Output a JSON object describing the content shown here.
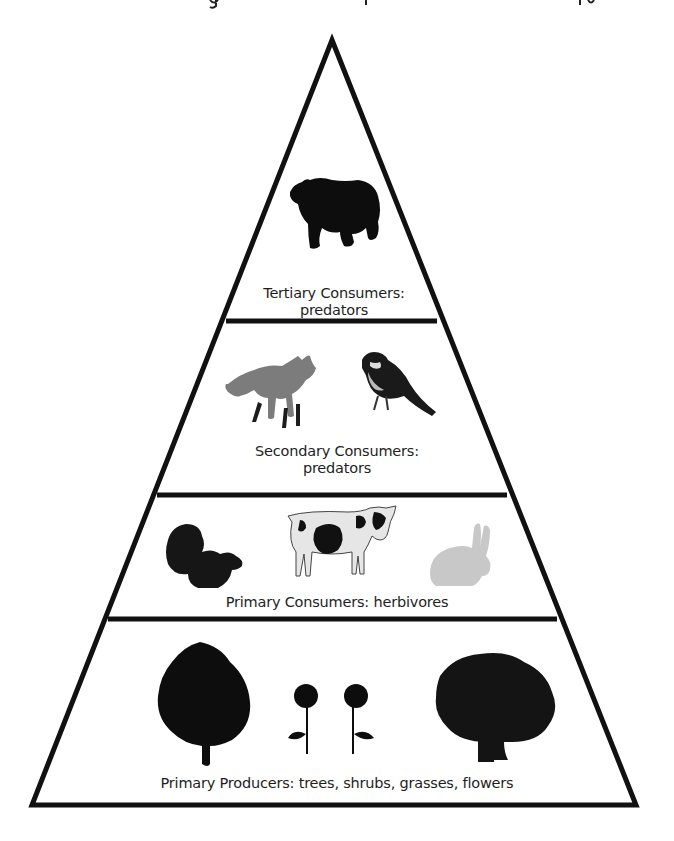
{
  "diagram": {
    "type": "ecological-pyramid",
    "levels": [
      {
        "id": "tertiary",
        "label_line1": "Tertiary Consumers:",
        "label_line2": "predators",
        "organisms": [
          "bear"
        ]
      },
      {
        "id": "secondary",
        "label_line1": "Secondary Consumers:",
        "label_line2": "predators",
        "organisms": [
          "fox",
          "bird"
        ]
      },
      {
        "id": "primary-consumers",
        "label_line1": "Primary Consumers: herbivores",
        "organisms": [
          "squirrel",
          "cow",
          "rabbit"
        ]
      },
      {
        "id": "producers",
        "label_line1": "Primary Producers: trees, shrubs, grasses, flowers",
        "organisms": [
          "tree",
          "rose",
          "rose",
          "oak-tree"
        ]
      }
    ],
    "colors": {
      "outline": "#111111",
      "text": "#1e1e1e",
      "background": "#ffffff",
      "silhouette": "#0d0d0d",
      "photo_gray": "#8a8a8a"
    }
  }
}
